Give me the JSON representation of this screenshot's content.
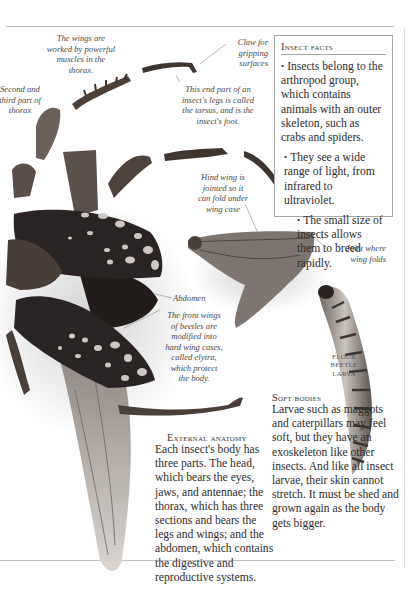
{
  "page": {
    "background": "#ffffff",
    "ink_color": "#2c2c2c"
  },
  "captions": {
    "wings_muscles": "The wings are worked by powerful muscles in the thorax.",
    "second_third_thorax": "Second and third part of thorax",
    "claw": "Claw for gripping surfaces",
    "tarsus": "This end part of an insect's legs is called the tarsus, and is the insect's foot.",
    "hind_wing": "Hind wing is jointed so it can fold under wing case",
    "joint": "Joint where wing folds",
    "abdomen": "Abdomen",
    "front_wings": "The front wings of beetles are modified into hard wing cases, called elytra, which protect the body."
  },
  "captions_lines": {
    "wings_muscles": [
      "The wings are",
      "worked by powerful",
      "muscles in the",
      "thorax."
    ],
    "second_third_thorax": [
      "Second and",
      "third part of",
      "thorax"
    ],
    "claw": [
      "Claw for",
      "gripping",
      "surfaces"
    ],
    "tarsus": [
      "This end part of an",
      "insect's legs is called",
      "the tarsus, and is the",
      "insect's foot."
    ],
    "hind_wing": [
      "Hind wing is",
      "jointed so it",
      "can fold under",
      "wing case"
    ],
    "joint": [
      "Joint where",
      "wing folds"
    ],
    "front_wings": [
      "The front wings",
      "of beetles are",
      "modified into",
      "hard wing cases,",
      "called elytra,",
      "which protect",
      "the body."
    ]
  },
  "larva_label": {
    "lines": [
      "FLOUR",
      "BEETLE",
      "LARVA"
    ]
  },
  "insect_facts": {
    "title": "Insect facts",
    "items": [
      "Insects belong to the arthropod group, which contains animals with an outer skeleton, such as crabs and spiders.",
      "They see a wide range of light, from infrared to ultraviolet.",
      "The small size of insects allows them to breed rapidly."
    ],
    "bullet": "•"
  },
  "external_anatomy": {
    "title": "External anatomy",
    "body": "Each insect's body has three parts. The head, which bears the eyes, jaws, and antennae; the thorax, which has three sections and bears the legs and wings; and the abdomen, which contains the digestive and reproductive systems."
  },
  "soft_bodies": {
    "title": "Soft bodies",
    "body": "Larvae such as maggots and caterpillars may feel soft, but they have an exoskeleton like other insects. And like all insect larvae, their skin cannot stretch. It must be shed and grown again as the body gets bigger."
  },
  "colors": {
    "beetle_elytra": "#2b2424",
    "elytra_spots": "#cfc8c2",
    "leg_brown": "#4a3c35",
    "wing_membrane": "#b9b3ad",
    "rule": "#b9b9b9"
  }
}
